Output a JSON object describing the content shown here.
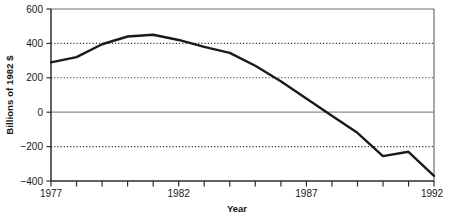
{
  "chart_data": {
    "type": "line",
    "title": "",
    "xlabel": "Year",
    "ylabel": "Billions of 1982 $",
    "x": [
      1977,
      1978,
      1979,
      1980,
      1981,
      1982,
      1983,
      1984,
      1985,
      1986,
      1987,
      1988,
      1989,
      1990,
      1991,
      1992
    ],
    "values": [
      290,
      320,
      395,
      440,
      450,
      420,
      380,
      345,
      270,
      180,
      80,
      -20,
      -120,
      -255,
      -230,
      -370
    ],
    "series": [
      {
        "name": "Billions of 1982 $",
        "values": [
          290,
          320,
          395,
          440,
          450,
          420,
          380,
          345,
          270,
          180,
          80,
          -20,
          -120,
          -255,
          -230,
          -370
        ]
      }
    ],
    "xlim": [
      1977,
      1992
    ],
    "ylim": [
      -400,
      600
    ],
    "ytick_labels": [
      "600",
      "400",
      "200",
      "0",
      "-200",
      "-400"
    ],
    "ytick_values": [
      600,
      400,
      200,
      0,
      -200,
      -400
    ],
    "xtick_labels": [
      "1977",
      "1982",
      "1987",
      "1992"
    ],
    "xtick_values": [
      1977,
      1982,
      1987,
      1992
    ],
    "xtick_minor_values": [
      1978,
      1979,
      1980,
      1981,
      1983,
      1984,
      1985,
      1986,
      1988,
      1989,
      1990,
      1991
    ],
    "grid": "dotted horizontal gridlines at 400, 200, -200; solid zero line at 0",
    "gridline_values": [
      400,
      200,
      -200
    ],
    "zero_line_value": 0,
    "legend": "none",
    "legend_position": "none",
    "line_color": "#1a1a1a",
    "grid_color": "#2b2b2b",
    "axis_color": "#6b6b6b",
    "background_color": "#ffffff"
  },
  "axis": {
    "y_title": "Billions of 1982 $",
    "x_title": "Year",
    "y_ticks": [
      {
        "label": "600",
        "value": 600
      },
      {
        "label": "400",
        "value": 400
      },
      {
        "label": "200",
        "value": 200
      },
      {
        "label": "0",
        "value": 0
      },
      {
        "label": "−200",
        "value": -200
      },
      {
        "label": "−400",
        "value": -400
      }
    ],
    "x_ticks": [
      {
        "label": "1977",
        "value": 1977
      },
      {
        "label": "1982",
        "value": 1982
      },
      {
        "label": "1987",
        "value": 1987
      },
      {
        "label": "1992",
        "value": 1992
      }
    ]
  }
}
